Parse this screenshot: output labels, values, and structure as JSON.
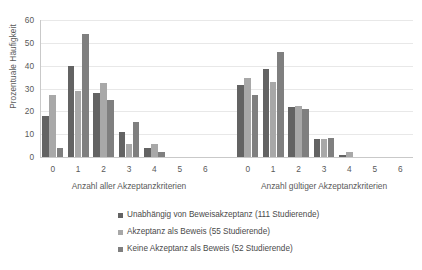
{
  "chart_data": {
    "type": "bar",
    "title": "",
    "subtitle": "",
    "ylabel": "Prozentuale Häufigkeit",
    "ylim": [
      0,
      60
    ],
    "yticks": [
      0,
      10,
      20,
      30,
      40,
      50,
      60
    ],
    "grid": true,
    "legend_position": "bottom",
    "series_names": [
      "Unabhängig von Beweisakzeptanz (111 Studierende)",
      "Akzeptanz als Beweis (55 Studierende)",
      "Keine Akzeptanz als Beweis (52 Studierende)"
    ],
    "series_colors": [
      "#636363",
      "#a8a8a8",
      "#7f7f7f"
    ],
    "panels": [
      {
        "xlabel": "Anzahl aller Akzeptanzkriterien",
        "categories": [
          "0",
          "1",
          "2",
          "3",
          "4",
          "5",
          "6"
        ],
        "series": [
          {
            "name": "Unabhängig von Beweisakzeptanz (111 Studierende)",
            "values": [
              18,
              40,
              28,
              11,
              4,
              0,
              0
            ]
          },
          {
            "name": "Akzeptanz als Beweis (55 Studierende)",
            "values": [
              27,
              29,
              32.5,
              5.5,
              5.5,
              0,
              0
            ]
          },
          {
            "name": "Keine Akzeptanz als Beweis (52 Studierende)",
            "values": [
              4,
              54,
              25,
              15.5,
              2,
              0,
              0
            ]
          }
        ]
      },
      {
        "xlabel": "Anzahl gültiger Akzeptanzkriterien",
        "categories": [
          "0",
          "1",
          "2",
          "3",
          "4",
          "5",
          "6"
        ],
        "series": [
          {
            "name": "Unabhängig von Beweisakzeptanz (111 Studierende)",
            "values": [
              31.5,
              38.5,
              22,
              8,
              1,
              0,
              0
            ]
          },
          {
            "name": "Akzeptanz als Beweis (55 Studierende)",
            "values": [
              34.5,
              33,
              22.5,
              8,
              2,
              0,
              0
            ]
          },
          {
            "name": "Keine Akzeptanz als Beweis (52 Studierende)",
            "values": [
              27,
              46,
              21,
              8.5,
              0,
              0,
              0
            ]
          }
        ]
      }
    ]
  },
  "legend": {
    "items": [
      {
        "label": "Unabhängig von Beweisakzeptanz (111 Studierende)",
        "color": "#636363"
      },
      {
        "label": "Akzeptanz als Beweis (55 Studierende)",
        "color": "#a8a8a8"
      },
      {
        "label": "Keine Akzeptanz als Beweis (52 Studierende)",
        "color": "#7f7f7f"
      }
    ]
  }
}
